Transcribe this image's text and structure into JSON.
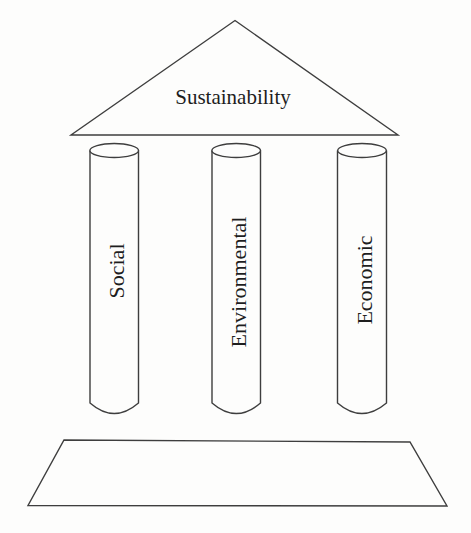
{
  "diagram": {
    "title": "Sustainability",
    "pillars": [
      {
        "label": "Social"
      },
      {
        "label": "Environmental"
      },
      {
        "label": "Economic"
      }
    ],
    "colors": {
      "line": "#3e3e3e",
      "text": "#1e1e1e",
      "background": "#fdfdfc"
    }
  }
}
